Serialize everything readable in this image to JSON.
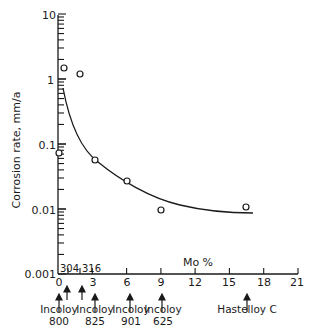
{
  "chart_data": {
    "type": "scatter",
    "title": "",
    "xlabel": "Mo %",
    "ylabel": "Corrosion rate, mm/a",
    "yscale": "log",
    "xlim": [
      0,
      21
    ],
    "ylim": [
      0.001,
      10
    ],
    "grid": false,
    "x_ticks": [
      "0",
      "3",
      "6",
      "9",
      "12",
      "15",
      "18",
      "21"
    ],
    "y_ticks": [
      "0.001",
      "0.01",
      "0.1",
      "1",
      "10"
    ],
    "series": [
      {
        "name": "measured",
        "marker": "open-circle",
        "points": [
          {
            "x": 0.5,
            "y": 1.5
          },
          {
            "x": 1.9,
            "y": 1.2
          },
          {
            "x": 0.1,
            "y": 0.075
          },
          {
            "x": 3.2,
            "y": 0.06
          },
          {
            "x": 6.0,
            "y": 0.028
          },
          {
            "x": 9.0,
            "y": 0.01
          },
          {
            "x": 16.5,
            "y": 0.011
          }
        ]
      },
      {
        "name": "trend curve",
        "type": "line",
        "points": [
          {
            "x": 0.4,
            "y": 0.75
          },
          {
            "x": 3.0,
            "y": 0.06
          },
          {
            "x": 6.0,
            "y": 0.022
          },
          {
            "x": 9.0,
            "y": 0.013
          },
          {
            "x": 12.0,
            "y": 0.0098
          },
          {
            "x": 17.0,
            "y": 0.0085
          }
        ]
      }
    ],
    "annotations": {
      "inline_labels": [
        "304",
        "316"
      ],
      "alloys": [
        {
          "name": "Incoloy",
          "grade": "800",
          "x": 0
        },
        {
          "name": "Incoloy",
          "grade": "825",
          "x": 3
        },
        {
          "name": "Incoloy",
          "grade": "901",
          "x": 6
        },
        {
          "name": "Incoloy",
          "grade": "625",
          "x": 9
        },
        {
          "name": "Hastelloy C",
          "grade": "",
          "x": 16.5
        }
      ]
    }
  }
}
